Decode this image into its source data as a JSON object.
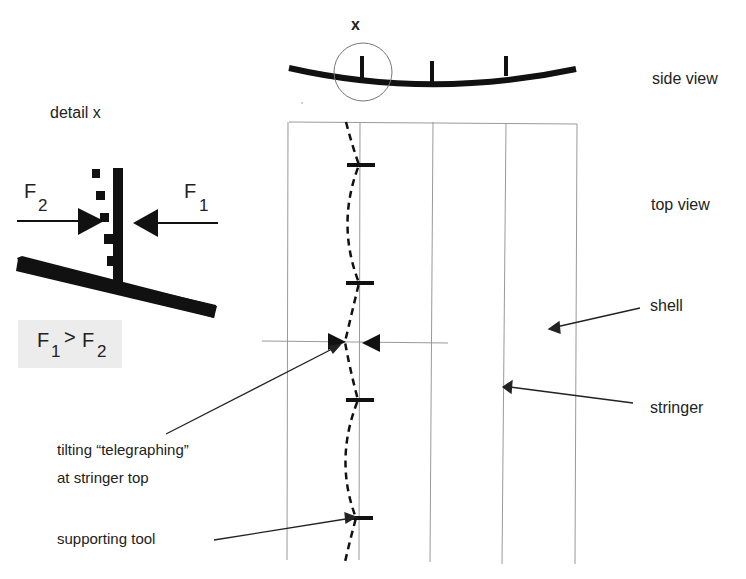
{
  "labels": {
    "detail_marker": "x",
    "detail_title": "detail x",
    "side_view": "side view",
    "top_view": "top view",
    "shell": "shell",
    "stringer": "stringer",
    "tilting_line1": "tilting “telegraphing”",
    "tilting_line2": "at stringer top",
    "supporting_tool": "supporting tool"
  },
  "forces": {
    "f2": {
      "symbol": "F",
      "subscript": "2"
    },
    "f1": {
      "symbol": "F",
      "subscript": "1"
    },
    "inequality": {
      "left": "F",
      "left_sub": "1",
      "op": ">",
      "right": "F",
      "right_sub": "2"
    }
  },
  "colors": {
    "ink": "#111111",
    "thin_line": "#8a8a8a",
    "inequality_bg": "#ececec"
  }
}
